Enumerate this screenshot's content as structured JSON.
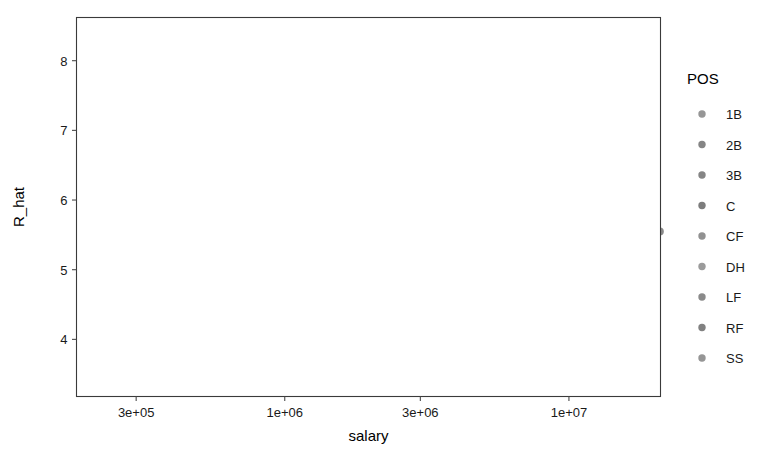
{
  "chart_data": {
    "type": "scatter",
    "title": "",
    "xlabel": "salary",
    "ylabel": "R_hat",
    "xscale": "log",
    "yscale": "linear",
    "grid": true,
    "legend": {
      "position": "right",
      "title": "POS",
      "entries": [
        {
          "label": "1B",
          "color": "#8b8b8b"
        },
        {
          "label": "2B",
          "color": "#787878"
        },
        {
          "label": "3B",
          "color": "#787878"
        },
        {
          "label": "C",
          "color": "#6f6f6f"
        },
        {
          "label": "CF",
          "color": "#858585"
        },
        {
          "label": "DH",
          "color": "#909090"
        },
        {
          "label": "LF",
          "color": "#7d7d7d"
        },
        {
          "label": "RF",
          "color": "#737373"
        },
        {
          "label": "SS",
          "color": "#8a8a8a"
        }
      ]
    },
    "xticks": [
      {
        "value": 300000,
        "label": "3e+05"
      },
      {
        "value": 1000000,
        "label": "1e+06"
      },
      {
        "value": 3000000,
        "label": "3e+06"
      },
      {
        "value": 10000000,
        "label": "1e+07"
      }
    ],
    "yticks": [
      {
        "value": 4,
        "label": "4"
      },
      {
        "value": 5,
        "label": "5"
      },
      {
        "value": 6,
        "label": "6"
      },
      {
        "value": 7,
        "label": "7"
      },
      {
        "value": 8,
        "label": "8"
      }
    ],
    "xlim": [
      185000,
      21000000
    ],
    "ylim": [
      3.18,
      8.62
    ],
    "point_color": "#7c7c7c",
    "point_radius": 3.9,
    "point_opacity": 0.9,
    "points": [
      [
        230000,
        5.3
      ],
      [
        250000,
        3.72
      ],
      [
        268000,
        4.62
      ],
      [
        272000,
        5.14
      ],
      [
        276000,
        4.95
      ],
      [
        286000,
        5.93
      ],
      [
        300000,
        4.4
      ],
      [
        312000,
        5.55
      ],
      [
        318000,
        4.49
      ],
      [
        322000,
        4.3
      ],
      [
        330000,
        4.5
      ],
      [
        336000,
        4.12
      ],
      [
        344000,
        4.6
      ],
      [
        352000,
        4.37
      ],
      [
        358000,
        3.86
      ],
      [
        362000,
        7.2
      ],
      [
        366000,
        6.47
      ],
      [
        370000,
        5.9
      ],
      [
        374000,
        5.05
      ],
      [
        378000,
        4.44
      ],
      [
        382000,
        4.22
      ],
      [
        386000,
        3.42
      ],
      [
        392000,
        4.62
      ],
      [
        398000,
        4.33
      ],
      [
        404000,
        4.15
      ],
      [
        410000,
        4.86
      ],
      [
        416000,
        4.58
      ],
      [
        420000,
        4.34
      ],
      [
        426000,
        4.12
      ],
      [
        432000,
        4.29
      ],
      [
        440000,
        4.05
      ],
      [
        446000,
        3.95
      ],
      [
        452000,
        4.45
      ],
      [
        458000,
        4.25
      ],
      [
        464000,
        4.18
      ],
      [
        470000,
        4.72
      ],
      [
        476000,
        4.55
      ],
      [
        482000,
        4.38
      ],
      [
        488000,
        4.2
      ],
      [
        492000,
        3.8
      ],
      [
        498000,
        4.64
      ],
      [
        505000,
        4.41
      ],
      [
        512000,
        4.26
      ],
      [
        520000,
        5.18
      ],
      [
        528000,
        4.9
      ],
      [
        536000,
        4.46
      ],
      [
        545000,
        4.18
      ],
      [
        554000,
        4.33
      ],
      [
        562000,
        3.88
      ],
      [
        570000,
        4.58
      ],
      [
        580000,
        4.7
      ],
      [
        590000,
        4.95
      ],
      [
        600000,
        4.52
      ],
      [
        612000,
        4.3
      ],
      [
        624000,
        4.14
      ],
      [
        636000,
        4.7
      ],
      [
        648000,
        4.44
      ],
      [
        660000,
        4.26
      ],
      [
        672000,
        4.88
      ],
      [
        686000,
        4.6
      ],
      [
        700000,
        6.1
      ],
      [
        714000,
        5.4
      ],
      [
        728000,
        5.05
      ],
      [
        742000,
        4.8
      ],
      [
        756000,
        4.62
      ],
      [
        770000,
        4.48
      ],
      [
        786000,
        4.36
      ],
      [
        800000,
        4.22
      ],
      [
        816000,
        4.05
      ],
      [
        832000,
        3.82
      ],
      [
        850000,
        5.22
      ],
      [
        868000,
        5.02
      ],
      [
        886000,
        4.86
      ],
      [
        904000,
        4.7
      ],
      [
        922000,
        4.54
      ],
      [
        940000,
        4.38
      ],
      [
        960000,
        5.28
      ],
      [
        980000,
        5.12
      ],
      [
        1000000,
        4.96
      ],
      [
        1020000,
        4.8
      ],
      [
        1040000,
        4.64
      ],
      [
        1060000,
        4.48
      ],
      [
        1080000,
        5.42
      ],
      [
        1100000,
        5.18
      ],
      [
        1130000,
        5.0
      ],
      [
        1160000,
        4.84
      ],
      [
        1190000,
        4.68
      ],
      [
        1220000,
        4.52
      ],
      [
        1250000,
        5.36
      ],
      [
        1280000,
        5.14
      ],
      [
        1310000,
        4.98
      ],
      [
        1340000,
        4.82
      ],
      [
        1380000,
        4.66
      ],
      [
        1420000,
        4.4
      ],
      [
        1460000,
        4.2
      ],
      [
        1500000,
        5.5
      ],
      [
        1540000,
        5.3
      ],
      [
        1580000,
        5.1
      ],
      [
        1620000,
        4.92
      ],
      [
        1660000,
        4.74
      ],
      [
        1700000,
        4.56
      ],
      [
        1750000,
        5.6
      ],
      [
        1800000,
        5.38
      ],
      [
        1850000,
        5.16
      ],
      [
        1900000,
        4.98
      ],
      [
        1950000,
        4.8
      ],
      [
        2000000,
        4.6
      ],
      [
        2060000,
        5.52
      ],
      [
        2120000,
        5.28
      ],
      [
        2180000,
        5.08
      ],
      [
        2240000,
        4.88
      ],
      [
        2300000,
        4.7
      ],
      [
        2360000,
        4.5
      ],
      [
        2420000,
        5.95
      ],
      [
        2480000,
        5.7
      ],
      [
        2540000,
        5.46
      ],
      [
        2600000,
        5.26
      ],
      [
        2660000,
        5.06
      ],
      [
        2720000,
        4.86
      ],
      [
        2800000,
        5.8
      ],
      [
        2880000,
        5.58
      ],
      [
        2960000,
        5.36
      ],
      [
        3050000,
        5.16
      ],
      [
        3150000,
        4.96
      ],
      [
        3250000,
        4.76
      ],
      [
        3350000,
        3.55
      ],
      [
        3450000,
        6.0
      ],
      [
        3550000,
        5.78
      ],
      [
        3650000,
        5.56
      ],
      [
        3750000,
        5.34
      ],
      [
        3850000,
        5.12
      ],
      [
        3950000,
        4.92
      ],
      [
        4050000,
        6.48
      ],
      [
        4150000,
        6.22
      ],
      [
        4250000,
        5.98
      ],
      [
        4350000,
        5.74
      ],
      [
        4450000,
        5.5
      ],
      [
        4550000,
        5.28
      ],
      [
        4650000,
        5.06
      ],
      [
        4750000,
        4.86
      ],
      [
        4850000,
        4.66
      ],
      [
        4950000,
        4.46
      ],
      [
        5050000,
        6.12
      ],
      [
        5150000,
        5.9
      ],
      [
        5250000,
        5.68
      ],
      [
        5350000,
        5.46
      ],
      [
        5450000,
        5.24
      ],
      [
        5550000,
        5.02
      ],
      [
        5650000,
        4.82
      ],
      [
        5750000,
        4.58
      ],
      [
        5850000,
        4.4
      ],
      [
        5950000,
        3.3
      ],
      [
        6100000,
        7.72
      ],
      [
        6250000,
        6.3
      ],
      [
        6400000,
        6.06
      ],
      [
        6550000,
        5.84
      ],
      [
        6700000,
        5.62
      ],
      [
        6850000,
        5.4
      ],
      [
        7000000,
        5.18
      ],
      [
        7150000,
        4.98
      ],
      [
        7300000,
        4.78
      ],
      [
        7450000,
        4.58
      ],
      [
        7600000,
        6.6
      ],
      [
        7750000,
        6.36
      ],
      [
        7900000,
        6.14
      ],
      [
        8050000,
        5.92
      ],
      [
        8200000,
        5.7
      ],
      [
        8400000,
        5.48
      ],
      [
        8600000,
        5.26
      ],
      [
        8800000,
        5.06
      ],
      [
        9000000,
        4.86
      ],
      [
        9200000,
        6.95
      ],
      [
        9400000,
        6.74
      ],
      [
        9600000,
        6.52
      ],
      [
        9800000,
        6.3
      ],
      [
        10000000,
        6.1
      ],
      [
        10200000,
        5.9
      ],
      [
        10400000,
        5.68
      ],
      [
        10600000,
        5.48
      ],
      [
        10800000,
        7.22
      ],
      [
        11000000,
        7.02
      ],
      [
        11200000,
        6.82
      ],
      [
        11400000,
        6.62
      ],
      [
        11600000,
        6.42
      ],
      [
        11800000,
        6.22
      ],
      [
        12000000,
        6.02
      ],
      [
        12300000,
        7.14
      ],
      [
        12600000,
        6.92
      ],
      [
        12900000,
        6.7
      ],
      [
        13200000,
        6.5
      ],
      [
        13500000,
        6.28
      ],
      [
        13800000,
        6.08
      ],
      [
        14100000,
        5.88
      ],
      [
        14500000,
        7.1
      ],
      [
        14900000,
        6.88
      ],
      [
        15300000,
        6.66
      ],
      [
        15700000,
        6.46
      ],
      [
        16100000,
        6.24
      ],
      [
        16500000,
        6.04
      ],
      [
        17000000,
        8.3
      ],
      [
        17600000,
        7.66
      ],
      [
        18200000,
        7.16
      ],
      [
        18800000,
        6.12
      ],
      [
        19500000,
        8.42
      ],
      [
        20300000,
        6.96
      ],
      [
        20900000,
        5.55
      ],
      [
        520000,
        5.02
      ],
      [
        560000,
        4.78
      ],
      [
        620000,
        4.92
      ],
      [
        680000,
        5.22
      ],
      [
        740000,
        4.4
      ],
      [
        810000,
        4.72
      ],
      [
        880000,
        4.58
      ],
      [
        950000,
        4.42
      ],
      [
        1030000,
        5.28
      ],
      [
        1110000,
        4.74
      ],
      [
        1210000,
        5.08
      ],
      [
        1320000,
        4.9
      ],
      [
        1430000,
        5.22
      ],
      [
        1550000,
        4.86
      ],
      [
        1680000,
        5.04
      ],
      [
        1820000,
        4.74
      ],
      [
        1980000,
        5.42
      ],
      [
        2150000,
        5.14
      ],
      [
        2330000,
        4.94
      ],
      [
        2520000,
        5.3
      ],
      [
        2730000,
        5.02
      ],
      [
        2950000,
        5.44
      ],
      [
        3200000,
        5.24
      ],
      [
        3470000,
        5.88
      ],
      [
        3760000,
        5.64
      ],
      [
        4080000,
        6.08
      ],
      [
        4420000,
        5.82
      ],
      [
        4790000,
        5.6
      ],
      [
        5190000,
        5.38
      ],
      [
        5620000,
        5.16
      ],
      [
        6090000,
        6.42
      ],
      [
        6600000,
        6.18
      ],
      [
        7150000,
        5.96
      ],
      [
        7750000,
        6.66
      ],
      [
        8400000,
        6.44
      ],
      [
        9100000,
        6.22
      ],
      [
        9850000,
        7.08
      ],
      [
        10700000,
        6.86
      ],
      [
        11600000,
        6.64
      ],
      [
        12550000,
        7.18
      ],
      [
        13600000,
        6.96
      ],
      [
        14700000,
        6.74
      ],
      [
        15900000,
        6.58
      ],
      [
        420000,
        5.72
      ],
      [
        455000,
        5.48
      ],
      [
        495000,
        5.26
      ],
      [
        540000,
        5.08
      ],
      [
        595000,
        4.88
      ],
      [
        650000,
        4.68
      ],
      [
        712000,
        4.52
      ],
      [
        780000,
        4.34
      ],
      [
        855000,
        4.16
      ],
      [
        935000,
        4.04
      ]
    ]
  }
}
